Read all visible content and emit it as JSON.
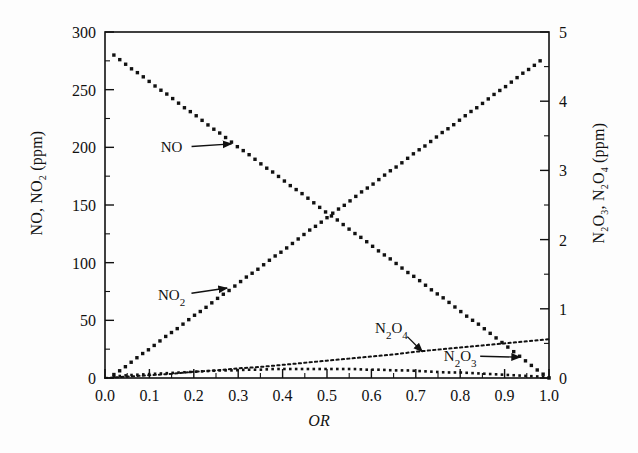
{
  "chart_data": {
    "type": "scatter",
    "title": "",
    "xlabel": "OR",
    "ylabel": "NO, NO2 (ppm)",
    "ylabel_right": "N2O3, N2O4 (ppm)",
    "xlim": [
      0.0,
      1.0
    ],
    "ylim": [
      0,
      300
    ],
    "ylim_right": [
      0,
      5
    ],
    "grid": false,
    "legend": "none (inline annotations with arrows)",
    "xticks": [
      "0.0",
      "0.1",
      "0.2",
      "0.3",
      "0.4",
      "0.5",
      "0.6",
      "0.7",
      "0.8",
      "0.9",
      "1.0"
    ],
    "xtick_values": [
      0.0,
      0.1,
      0.2,
      0.3,
      0.4,
      0.5,
      0.6,
      0.7,
      0.8,
      0.9,
      1.0
    ],
    "xminor_step": 0.05,
    "yticks_left": [
      "0",
      "50",
      "100",
      "150",
      "200",
      "250",
      "300"
    ],
    "ytick_values_left": [
      0,
      50,
      100,
      150,
      200,
      250,
      300
    ],
    "yminor_step_left": 25,
    "yticks_right": [
      "0",
      "1",
      "2",
      "3",
      "4",
      "5"
    ],
    "ytick_values_right": [
      0,
      1,
      2,
      3,
      4,
      5
    ],
    "yminor_step_right": 0.5,
    "series": [
      {
        "name": "NO",
        "axis": "left",
        "marker": "filled-square",
        "style": "dotted-markers",
        "x": [
          0.02,
          0.04,
          0.06,
          0.08,
          0.1,
          0.12,
          0.14,
          0.16,
          0.18,
          0.2,
          0.22,
          0.24,
          0.26,
          0.28,
          0.3,
          0.32,
          0.34,
          0.36,
          0.38,
          0.4,
          0.42,
          0.44,
          0.46,
          0.48,
          0.5,
          0.52,
          0.54,
          0.56,
          0.58,
          0.6,
          0.62,
          0.64,
          0.66,
          0.68,
          0.7,
          0.72,
          0.74,
          0.76,
          0.78,
          0.8,
          0.82,
          0.84,
          0.86,
          0.88,
          0.9,
          0.92,
          0.94,
          0.96,
          0.98,
          1.0
        ],
        "values": [
          280,
          274,
          268,
          263,
          257,
          251,
          246,
          240,
          234,
          229,
          223,
          217,
          212,
          206,
          200,
          195,
          189,
          183,
          178,
          172,
          166,
          161,
          155,
          149,
          143,
          138,
          132,
          126,
          121,
          115,
          109,
          104,
          98,
          92,
          87,
          81,
          75,
          70,
          64,
          58,
          52,
          47,
          41,
          35,
          29,
          23,
          17,
          11,
          5,
          0
        ]
      },
      {
        "name": "NO2",
        "axis": "left",
        "marker": "filled-square",
        "style": "dotted-markers",
        "x": [
          0.02,
          0.04,
          0.06,
          0.08,
          0.1,
          0.12,
          0.14,
          0.16,
          0.18,
          0.2,
          0.22,
          0.24,
          0.26,
          0.28,
          0.3,
          0.32,
          0.34,
          0.36,
          0.38,
          0.4,
          0.42,
          0.44,
          0.46,
          0.48,
          0.5,
          0.52,
          0.54,
          0.56,
          0.58,
          0.6,
          0.62,
          0.64,
          0.66,
          0.68,
          0.7,
          0.72,
          0.74,
          0.76,
          0.78,
          0.8,
          0.82,
          0.84,
          0.86,
          0.88,
          0.9,
          0.92,
          0.94,
          0.96,
          0.98
        ],
        "values": [
          3,
          8,
          14,
          20,
          25,
          31,
          37,
          42,
          48,
          54,
          59,
          65,
          71,
          76,
          82,
          88,
          93,
          99,
          105,
          110,
          116,
          122,
          128,
          133,
          139,
          145,
          150,
          156,
          162,
          167,
          173,
          179,
          184,
          190,
          196,
          201,
          207,
          213,
          218,
          224,
          230,
          235,
          241,
          247,
          252,
          258,
          264,
          269,
          275
        ]
      },
      {
        "name": "N2O4",
        "axis": "right",
        "marker": "dot",
        "style": "dotted-line",
        "x": [
          0.0,
          0.05,
          0.1,
          0.15,
          0.2,
          0.25,
          0.3,
          0.35,
          0.4,
          0.45,
          0.5,
          0.55,
          0.6,
          0.65,
          0.7,
          0.75,
          0.8,
          0.85,
          0.9,
          0.95,
          1.0
        ],
        "values": [
          0.0,
          0.02,
          0.04,
          0.06,
          0.09,
          0.11,
          0.14,
          0.16,
          0.19,
          0.22,
          0.25,
          0.28,
          0.31,
          0.34,
          0.38,
          0.41,
          0.44,
          0.47,
          0.5,
          0.53,
          0.56
        ]
      },
      {
        "name": "N2O3",
        "axis": "right",
        "marker": "small-filled-square",
        "style": "dotted-markers",
        "x": [
          0.02,
          0.05,
          0.08,
          0.11,
          0.14,
          0.17,
          0.2,
          0.23,
          0.26,
          0.29,
          0.32,
          0.35,
          0.38,
          0.41,
          0.44,
          0.47,
          0.5,
          0.53,
          0.56,
          0.59,
          0.62,
          0.65,
          0.68,
          0.71,
          0.74,
          0.77,
          0.8,
          0.83,
          0.86,
          0.89,
          0.92,
          0.95,
          0.98,
          1.0
        ],
        "values": [
          0.02,
          0.04,
          0.05,
          0.06,
          0.07,
          0.08,
          0.09,
          0.1,
          0.11,
          0.11,
          0.12,
          0.12,
          0.13,
          0.13,
          0.13,
          0.13,
          0.13,
          0.13,
          0.13,
          0.12,
          0.12,
          0.11,
          0.11,
          0.1,
          0.09,
          0.08,
          0.08,
          0.07,
          0.06,
          0.05,
          0.04,
          0.03,
          0.02,
          0.01
        ]
      }
    ],
    "annotations": [
      {
        "label": "NO",
        "label_html": "NO",
        "x": 0.15,
        "y": 200,
        "axis": "left",
        "arrow_to_x": 0.285,
        "arrow_to_y": 203
      },
      {
        "label": "NO2",
        "label_html": "NO<sub>2</sub>",
        "x": 0.15,
        "y": 72,
        "axis": "left",
        "arrow_to_x": 0.275,
        "arrow_to_y": 78
      },
      {
        "label": "N2O4",
        "label_html": "N<sub>2</sub>O<sub>4</sub>",
        "x": 0.645,
        "y": 0.72,
        "axis": "right",
        "arrow_to_x": 0.715,
        "arrow_to_y": 0.38
      },
      {
        "label": "N2O3",
        "label_html": "N<sub>2</sub>O<sub>3</sub>",
        "x": 0.8,
        "y": 0.32,
        "axis": "right",
        "arrow_to_x": 0.935,
        "arrow_to_y": 0.3
      }
    ]
  },
  "axes": {
    "left_title_html": "NO, NO<sub>2</sub> (ppm)",
    "right_title_html": "N<sub>2</sub>O<sub>3</sub>, N<sub>2</sub>O<sub>4</sub> (ppm)",
    "x_title": "OR"
  },
  "colors": {
    "ink": "#111111",
    "frame": "#111111",
    "background": "#fdfdfd"
  }
}
